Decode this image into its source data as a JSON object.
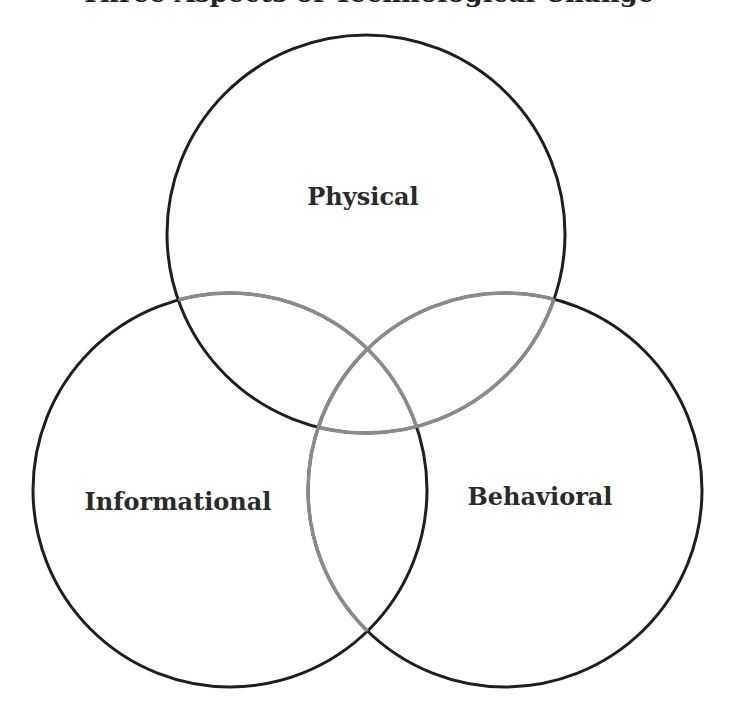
{
  "title": "Three Aspects of Technological Change",
  "circles": [
    {
      "id": "physical",
      "label": "Physical",
      "cx": 366,
      "cy": 234,
      "r": 199
    },
    {
      "id": "informational",
      "label": "Informational",
      "cx": 230,
      "cy": 490,
      "r": 197
    },
    {
      "id": "behavioral",
      "label": "Behavioral",
      "cx": 505,
      "cy": 490,
      "r": 197
    }
  ],
  "colors": {
    "stroke": "#1e1e1e",
    "stroke_faded": "#8a8a8a",
    "text": "#2a2a2a",
    "background": "#ffffff"
  }
}
